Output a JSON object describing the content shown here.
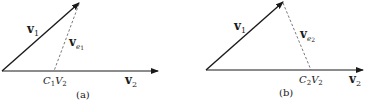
{
  "panels": [
    {
      "id": "a",
      "caption": "(a)",
      "v1_label": "v",
      "v1_sub": "1",
      "v2_label": "v",
      "v2_sub": "2",
      "ve_label": "v",
      "ve_sub_e": "e",
      "ve_sub_n": "1",
      "proj_C": "C",
      "proj_C_sub": "1",
      "proj_V": "V",
      "proj_V_sub": "2"
    },
    {
      "id": "b",
      "caption": "(b)",
      "v1_label": "v",
      "v1_sub": "1",
      "v2_label": "v",
      "v2_sub": "2",
      "ve_label": "v",
      "ve_sub_e": "e",
      "ve_sub_n": "2",
      "proj_C": "C",
      "proj_C_sub": "2",
      "proj_V": "V",
      "proj_V_sub": "2"
    }
  ],
  "colors": {
    "line": "#1a1a1a",
    "dashed": "#555555"
  }
}
